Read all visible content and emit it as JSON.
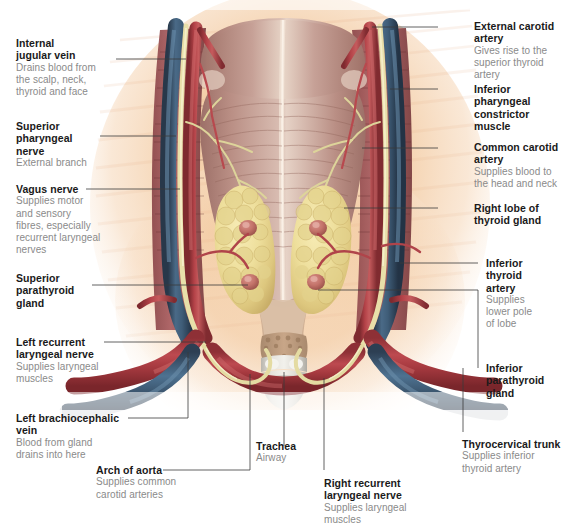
{
  "figure": {
    "background_color": "#ffffff",
    "tissue_colors": {
      "skin_bg": "#f3c9a6",
      "muscle": "#b08a80",
      "artery": "#a83a3f",
      "vein": "#3d5871",
      "nerve": "#e3d9a4",
      "thyroid": "#eee0a0",
      "parathyroid": "#c4736a",
      "cartilage": "#d8d8d2"
    }
  },
  "labels": [
    {
      "id": "internal-jugular-vein",
      "title": "Internal\njugular vein",
      "desc": "Drains blood from\nthe scalp, neck,\nthyroid and face",
      "side": "left"
    },
    {
      "id": "superior-pharyngeal-nerve",
      "title": "Superior\npharyngeal\nnerve",
      "desc": "External branch",
      "side": "left"
    },
    {
      "id": "vagus-nerve",
      "title": "Vagus nerve",
      "desc": "Supplies motor\nand sensory\nfibres, especially\nrecurrent laryngeal\nnerves",
      "side": "left"
    },
    {
      "id": "superior-parathyroid-gland",
      "title": "Superior\nparathyroid\ngland",
      "desc": "",
      "side": "left"
    },
    {
      "id": "left-recurrent-laryngeal-nerve",
      "title": "Left recurrent\nlaryngeal nerve",
      "desc": "Supplies laryngeal\nmuscles",
      "side": "left"
    },
    {
      "id": "left-brachiocephalic-vein",
      "title": "Left brachiocephalic\nvein",
      "desc": "Blood from gland\ndrains into here",
      "side": "left"
    },
    {
      "id": "arch-of-aorta",
      "title": "Arch of aorta",
      "desc": "Supplies common\ncarotid arteries",
      "side": "bottom"
    },
    {
      "id": "trachea",
      "title": "Trachea",
      "desc": "Airway",
      "side": "bottom"
    },
    {
      "id": "right-recurrent-laryngeal-nerve",
      "title": "Right recurrent\nlaryngeal nerve",
      "desc": "Supplies laryngeal\nmuscles",
      "side": "bottom"
    },
    {
      "id": "thyrocervical-trunk",
      "title": "Thyrocervical trunk",
      "desc": "Supplies inferior\nthyroid artery",
      "side": "bottom"
    },
    {
      "id": "external-carotid-artery",
      "title": "External carotid\nartery",
      "desc": "Gives rise to the\nsuperior thyroid\nartery",
      "side": "right"
    },
    {
      "id": "inferior-pharyngeal-constrictor-muscle",
      "title": "Inferior pharyngeal\nconstrictor muscle",
      "desc": "",
      "side": "right"
    },
    {
      "id": "common-carotid-artery",
      "title": "Common carotid\nartery",
      "desc": "Supplies blood to\nthe head and neck",
      "side": "right"
    },
    {
      "id": "right-lobe-of-thyroid-gland",
      "title": "Right lobe of\nthyroid gland",
      "desc": "",
      "side": "right"
    },
    {
      "id": "inferior-thyroid-artery",
      "title": "Inferior\nthyroid\nartery",
      "desc": "Supplies\nlower pole\nof lobe",
      "side": "right"
    },
    {
      "id": "inferior-parathyroid-gland",
      "title": "Inferior\nparathyroid\ngland",
      "desc": "",
      "side": "right"
    }
  ]
}
